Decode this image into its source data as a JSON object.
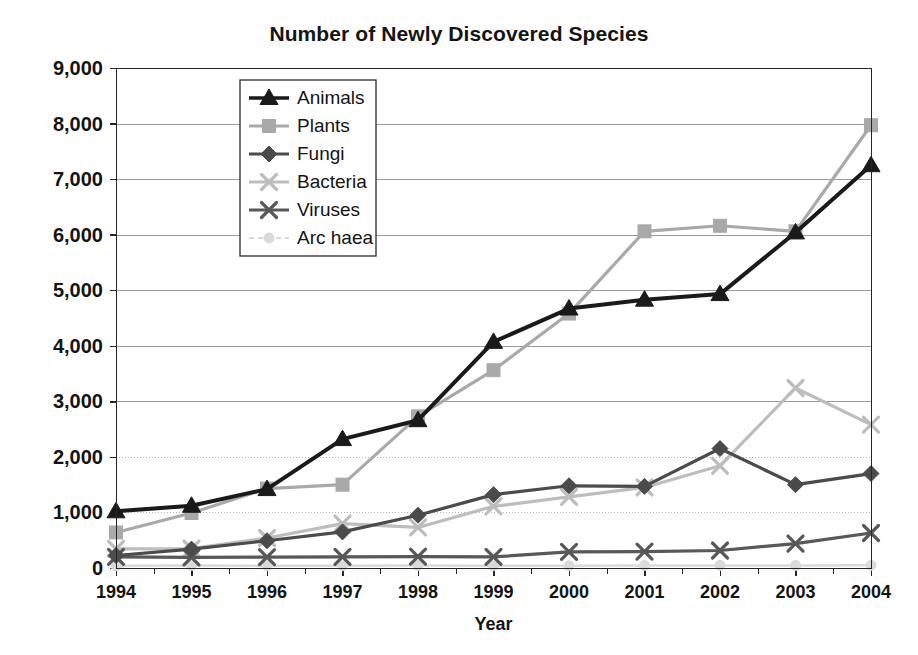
{
  "chart_data": {
    "type": "line",
    "title": "Number of Newly Discovered Species",
    "xlabel": "Year",
    "ylabel": "",
    "categories": [
      "1994",
      "1995",
      "1996",
      "1997",
      "1998",
      "1999",
      "2000",
      "2001",
      "2002",
      "2003",
      "2004"
    ],
    "x": [
      1994,
      1995,
      1996,
      1997,
      1998,
      1999,
      2000,
      2001,
      2002,
      2003,
      2004
    ],
    "xlim": [
      1994,
      2004
    ],
    "ylim": [
      0,
      9000
    ],
    "ytick_labels": [
      "0",
      "1,000",
      "2,000",
      "3,000",
      "4,000",
      "5,000",
      "6,000",
      "7,000",
      "8,000",
      "9,000"
    ],
    "ytick_values": [
      0,
      1000,
      2000,
      3000,
      4000,
      5000,
      6000,
      7000,
      8000,
      9000
    ],
    "grid": true,
    "legend_position": "upper-left-inside",
    "series": [
      {
        "name": "Animals",
        "marker": "triangle",
        "color": "#1a1a1a",
        "values": [
          1020,
          1120,
          1420,
          2320,
          2660,
          4070,
          4670,
          4830,
          4930,
          6040,
          7250
        ]
      },
      {
        "name": "Plants",
        "marker": "square",
        "color": "#a9a9a9",
        "values": [
          640,
          990,
          1430,
          1500,
          2730,
          3560,
          4580,
          6060,
          6160,
          6060,
          7970
        ]
      },
      {
        "name": "Fungi",
        "marker": "diamond",
        "color": "#4b4b4b",
        "values": [
          225,
          340,
          490,
          650,
          950,
          1320,
          1480,
          1470,
          2150,
          1500,
          1700
        ]
      },
      {
        "name": "Bacteria",
        "marker": "x",
        "color": "#bdbdbd",
        "values": [
          345,
          350,
          540,
          800,
          730,
          1110,
          1280,
          1450,
          1840,
          3240,
          2580
        ]
      },
      {
        "name": "Viruses",
        "marker": "x",
        "color": "#585858",
        "values": [
          200,
          190,
          195,
          200,
          205,
          200,
          290,
          295,
          315,
          440,
          630
        ]
      },
      {
        "name": "Arc haea",
        "marker": "circle",
        "color": "#dadada",
        "values": [
          40,
          45,
          40,
          40,
          45,
          40,
          40,
          45,
          45,
          45,
          50
        ]
      }
    ]
  },
  "colors": {
    "background": "#ffffff",
    "axis": "#262626",
    "grid": "#9a9a9a",
    "text": "#141414"
  }
}
